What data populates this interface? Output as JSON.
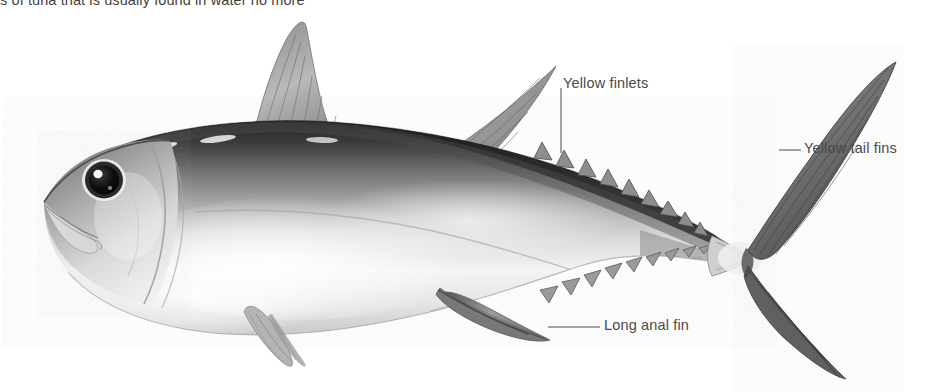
{
  "page": {
    "width": 933,
    "height": 392,
    "background_color": "#ffffff"
  },
  "caption": {
    "text": "s of tuna that is usually found in water no more",
    "color": "#3f3f3f",
    "clipped": "true"
  },
  "illustration": {
    "subject": "yellowfin tuna",
    "style": "grayscale pencil / airbrush scientific illustration",
    "orientation": "left-facing head, right-facing tail",
    "body_tone_dark": "#2b2b2b",
    "body_tone_mid": "#9a9a9a",
    "body_tone_light": "#f2f2f2",
    "fin_tone": "#6e6e6e",
    "eye_color": "#141414",
    "eye_highlight": "#ffffff",
    "parts": [
      {
        "name": "head",
        "label": "Head with pointed snout"
      },
      {
        "name": "eye",
        "label": "Large dark eye"
      },
      {
        "name": "first-dorsal-fin",
        "label": "First dorsal fin"
      },
      {
        "name": "second-dorsal-fin",
        "label": "Second dorsal fin (sickle shaped)"
      },
      {
        "name": "pectoral-fin",
        "label": "Pectoral fin"
      },
      {
        "name": "pelvic-fin",
        "label": "Pelvic fin"
      },
      {
        "name": "anal-fin",
        "label": "Anal fin"
      },
      {
        "name": "dorsal-finlets",
        "label": "Dorsal finlets"
      },
      {
        "name": "ventral-finlets",
        "label": "Ventral finlets"
      },
      {
        "name": "caudal-fin",
        "label": "Forked caudal fin"
      },
      {
        "name": "caudal-peduncle",
        "label": "Caudal peduncle keel"
      }
    ]
  },
  "callouts": [
    {
      "id": "yellow-finlets",
      "text": "Yellow finlets",
      "leader": {
        "type": "vertical",
        "x": 561,
        "y1": 88,
        "y2": 153
      },
      "label_position": {
        "left": 563,
        "top": 75
      }
    },
    {
      "id": "yellow-tail-fins",
      "text": "Yellow tail fins",
      "leader": {
        "type": "horizontal",
        "x1": 779,
        "x2": 801,
        "y": 150
      },
      "label_position": {
        "left": 804,
        "top": 140
      }
    },
    {
      "id": "long-anal-fin",
      "text": "Long anal fin",
      "leader": {
        "type": "horizontal",
        "x1": 548,
        "x2": 600,
        "y": 327
      },
      "label_position": {
        "left": 604,
        "top": 317
      }
    }
  ],
  "styles": {
    "label_color": "#4a4a4a",
    "leader_color": "#4a4a4a",
    "leader_width": 1
  }
}
